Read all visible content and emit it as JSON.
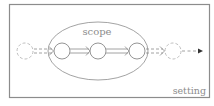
{
  "diagram": {
    "type": "flow-with-scope",
    "frame": {
      "label": "setting",
      "stroke": "#8c8c8c"
    },
    "scope": {
      "label": "scope",
      "stroke": "#8c8c8c"
    },
    "nodes": [
      {
        "id": "in",
        "style": "dashed",
        "stroke": "#b8b8b8"
      },
      {
        "id": "s1",
        "style": "solid",
        "stroke": "#7a7a7a"
      },
      {
        "id": "s2",
        "style": "solid",
        "stroke": "#7a7a7a"
      },
      {
        "id": "s3",
        "style": "solid",
        "stroke": "#7a7a7a"
      },
      {
        "id": "out",
        "style": "dashed",
        "stroke": "#b8b8b8"
      }
    ],
    "edges": [
      {
        "from": "in",
        "to": "s1",
        "style": "dashed-double"
      },
      {
        "from": "s1",
        "to": "s2",
        "style": "solid-double"
      },
      {
        "from": "s2",
        "to": "s3",
        "style": "solid-double"
      },
      {
        "from": "s3",
        "to": "out",
        "style": "dashed-double"
      },
      {
        "from": "out",
        "to": null,
        "style": "dashed-single"
      }
    ],
    "colors": {
      "label": "#8c8c8c",
      "arrowhead": "#333333"
    }
  }
}
